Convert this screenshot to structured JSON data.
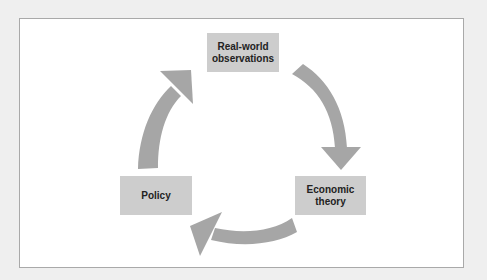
{
  "diagram": {
    "type": "cycle",
    "nodes": [
      {
        "id": "observations",
        "label_line1": "Real-world",
        "label_line2": "observations"
      },
      {
        "id": "theory",
        "label_line1": "Economic",
        "label_line2": "theory"
      },
      {
        "id": "policy",
        "label_line1": "Policy",
        "label_line2": ""
      }
    ],
    "edges": [
      {
        "from": "observations",
        "to": "theory"
      },
      {
        "from": "theory",
        "to": "policy"
      },
      {
        "from": "policy",
        "to": "observations"
      }
    ],
    "colors": {
      "background": "#efefef",
      "panel": "#ffffff",
      "panel_border": "#a9a9a9",
      "node_fill": "#cdcdcd",
      "arrow_fill": "#a6a6a6",
      "text": "#222222"
    }
  }
}
